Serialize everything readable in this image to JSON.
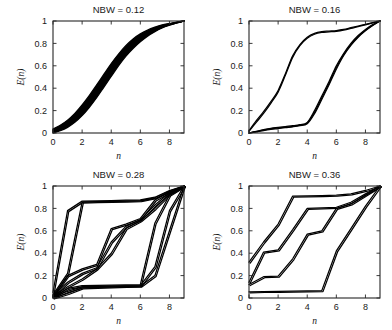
{
  "figure": {
    "background_color": "#ffffff",
    "curve_color": "#000000",
    "axis_color": "#262626",
    "panel_count": 4
  },
  "chart_data": [
    {
      "type": "line",
      "title": "NBW = 0.12",
      "xlabel": "n",
      "ylabel": "E(n)",
      "xlim": [
        0,
        9
      ],
      "ylim": [
        0,
        1
      ],
      "xticks": [
        0,
        2,
        4,
        6,
        8
      ],
      "yticks": [
        0,
        0.2,
        0.4,
        0.6,
        0.8,
        1
      ],
      "xtick_labels": [
        "0",
        "2",
        "4",
        "6",
        "8"
      ],
      "ytick_labels": [
        "0",
        "0.2",
        "0.4",
        "0.6",
        "0.8",
        "1"
      ],
      "grid": false,
      "legend": "none",
      "description": "Tight bundle of near-identical sigmoidal cumulative curves forming a single thick band",
      "x": [
        0,
        0.5,
        1,
        1.5,
        2,
        2.5,
        3,
        3.5,
        4,
        4.5,
        5,
        5.5,
        6,
        6.5,
        7,
        7.5,
        8,
        8.5,
        9
      ],
      "series": [
        {
          "name": "upper envelope",
          "values": [
            0.035,
            0.07,
            0.115,
            0.175,
            0.25,
            0.335,
            0.43,
            0.525,
            0.62,
            0.705,
            0.78,
            0.84,
            0.885,
            0.92,
            0.945,
            0.965,
            0.978,
            0.99,
            1.0
          ]
        },
        {
          "name": "lower envelope",
          "values": [
            0.0,
            0.02,
            0.05,
            0.095,
            0.155,
            0.23,
            0.315,
            0.41,
            0.505,
            0.6,
            0.685,
            0.755,
            0.815,
            0.865,
            0.905,
            0.938,
            0.962,
            0.982,
            1.0
          ]
        }
      ]
    },
    {
      "type": "line",
      "title": "NBW = 0.16",
      "xlabel": "n",
      "ylabel": "E(n)",
      "xlim": [
        0,
        9
      ],
      "ylim": [
        0,
        1
      ],
      "xticks": [
        0,
        2,
        4,
        6,
        8
      ],
      "yticks": [
        0,
        0.2,
        0.4,
        0.6,
        0.8,
        1
      ],
      "xtick_labels": [
        "0",
        "2",
        "4",
        "6",
        "8"
      ],
      "ytick_labels": [
        "0",
        "0.2",
        "0.4",
        "0.6",
        "0.8",
        "1"
      ],
      "grid": false,
      "legend": "none",
      "description": "Two separated bundles: a fast-rising upper branch and a delayed lower branch, both converging at n=9",
      "x": [
        0,
        0.5,
        1,
        1.5,
        2,
        2.5,
        3,
        3.5,
        4,
        4.5,
        5,
        5.5,
        6,
        6.5,
        7,
        7.5,
        8,
        8.5,
        9
      ],
      "series": [
        {
          "name": "upper branch",
          "values": [
            0.02,
            0.11,
            0.19,
            0.28,
            0.38,
            0.53,
            0.69,
            0.79,
            0.855,
            0.89,
            0.905,
            0.91,
            0.915,
            0.925,
            0.94,
            0.955,
            0.97,
            0.985,
            1.0
          ]
        },
        {
          "name": "upper branch 2",
          "values": [
            0.015,
            0.095,
            0.175,
            0.265,
            0.365,
            0.515,
            0.675,
            0.78,
            0.845,
            0.882,
            0.898,
            0.903,
            0.908,
            0.918,
            0.933,
            0.95,
            0.966,
            0.983,
            1.0
          ]
        },
        {
          "name": "lower branch",
          "values": [
            0.0,
            0.015,
            0.03,
            0.042,
            0.05,
            0.058,
            0.065,
            0.075,
            0.095,
            0.2,
            0.33,
            0.46,
            0.6,
            0.71,
            0.8,
            0.87,
            0.925,
            0.968,
            1.0
          ]
        },
        {
          "name": "lower branch 2",
          "values": [
            0.0,
            0.012,
            0.025,
            0.036,
            0.045,
            0.052,
            0.06,
            0.07,
            0.088,
            0.185,
            0.315,
            0.445,
            0.585,
            0.7,
            0.79,
            0.862,
            0.918,
            0.963,
            1.0
          ]
        },
        {
          "name": "lower branch 3",
          "values": [
            0.0,
            0.01,
            0.022,
            0.032,
            0.04,
            0.048,
            0.055,
            0.065,
            0.082,
            0.172,
            0.3,
            0.43,
            0.57,
            0.69,
            0.782,
            0.855,
            0.912,
            0.959,
            1.0
          ]
        }
      ]
    },
    {
      "type": "line",
      "title": "NBW = 0.28",
      "xlabel": "n",
      "ylabel": "E(n)",
      "xlim": [
        0,
        9
      ],
      "ylim": [
        0,
        1
      ],
      "xticks": [
        0,
        2,
        4,
        6,
        8
      ],
      "yticks": [
        0,
        0.2,
        0.4,
        0.6,
        0.8,
        1
      ],
      "xtick_labels": [
        "0",
        "2",
        "4",
        "6",
        "8"
      ],
      "ytick_labels": [
        "0",
        "0.2",
        "0.4",
        "0.6",
        "0.8",
        "1"
      ],
      "grid": false,
      "legend": "none",
      "description": "Multiple staircase trajectories with plateaus forming a wide lens/diamond envelope between n=0 and n=9",
      "x": [
        0,
        1,
        2,
        3,
        4,
        5,
        6,
        7,
        8,
        9
      ],
      "series": [
        {
          "name": "trajectory 1",
          "values": [
            0.05,
            0.78,
            0.865,
            0.868,
            0.87,
            0.873,
            0.876,
            0.9,
            0.96,
            1.0
          ]
        },
        {
          "name": "trajectory 2",
          "values": [
            0.03,
            0.22,
            0.855,
            0.86,
            0.862,
            0.865,
            0.87,
            0.895,
            0.955,
            1.0
          ]
        },
        {
          "name": "trajectory 3",
          "values": [
            0.02,
            0.2,
            0.26,
            0.3,
            0.62,
            0.66,
            0.71,
            0.875,
            0.95,
            1.0
          ]
        },
        {
          "name": "trajectory 4",
          "values": [
            0.02,
            0.14,
            0.22,
            0.27,
            0.5,
            0.64,
            0.7,
            0.83,
            0.94,
            1.0
          ]
        },
        {
          "name": "trajectory 5",
          "values": [
            0.015,
            0.1,
            0.17,
            0.26,
            0.4,
            0.62,
            0.69,
            0.8,
            0.93,
            1.0
          ]
        },
        {
          "name": "trajectory 6",
          "values": [
            0.01,
            0.085,
            0.11,
            0.112,
            0.115,
            0.118,
            0.12,
            0.67,
            0.92,
            1.0
          ]
        },
        {
          "name": "trajectory 7",
          "values": [
            0.005,
            0.06,
            0.1,
            0.103,
            0.105,
            0.108,
            0.11,
            0.28,
            0.78,
            1.0
          ]
        },
        {
          "name": "trajectory 8",
          "values": [
            0.0,
            0.04,
            0.09,
            0.095,
            0.1,
            0.103,
            0.105,
            0.2,
            0.6,
            1.0
          ]
        }
      ]
    },
    {
      "type": "line",
      "title": "NBW = 0.36",
      "xlabel": "n",
      "ylabel": "E(n)",
      "xlim": [
        0,
        9
      ],
      "ylim": [
        0,
        1
      ],
      "xticks": [
        0,
        2,
        4,
        6,
        8
      ],
      "yticks": [
        0,
        0.2,
        0.4,
        0.6,
        0.8,
        1
      ],
      "xtick_labels": [
        "0",
        "2",
        "4",
        "6",
        "8"
      ],
      "ytick_labels": [
        "0",
        "0.2",
        "0.4",
        "0.6",
        "0.8",
        "1"
      ],
      "grid": false,
      "legend": "none",
      "description": "Four well-separated staircase trajectories with long plateaus, all starting spread at n=0 and converging to 1 at n=9",
      "x": [
        0,
        1,
        2,
        3,
        4,
        5,
        6,
        7,
        8,
        9
      ],
      "series": [
        {
          "name": "trajectory 1",
          "values": [
            0.32,
            0.5,
            0.66,
            0.91,
            0.912,
            0.915,
            0.918,
            0.93,
            0.96,
            1.0
          ]
        },
        {
          "name": "trajectory 2",
          "values": [
            0.14,
            0.41,
            0.43,
            0.61,
            0.8,
            0.805,
            0.81,
            0.855,
            0.93,
            1.0
          ]
        },
        {
          "name": "trajectory 3",
          "values": [
            0.12,
            0.19,
            0.195,
            0.35,
            0.57,
            0.6,
            0.8,
            0.84,
            0.92,
            1.0
          ]
        },
        {
          "name": "trajectory 4",
          "values": [
            0.055,
            0.058,
            0.06,
            0.062,
            0.064,
            0.066,
            0.42,
            0.62,
            0.82,
            1.0
          ]
        }
      ]
    }
  ]
}
